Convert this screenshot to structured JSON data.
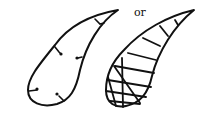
{
  "diagram": {
    "separator_label": "or",
    "left_shape": {
      "name": "teardrop with inward-pointing pin marks",
      "pin_count": 6
    },
    "right_shape": {
      "name": "teardrop with grid/hatch lines"
    },
    "colors": {
      "stroke": "#111111",
      "background": "#ffffff"
    }
  }
}
